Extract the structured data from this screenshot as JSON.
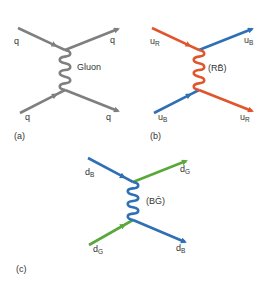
{
  "colors": {
    "gray": "#7f7f7f",
    "red": "#e0552b",
    "blue": "#2f6fb5",
    "green": "#5aa83c",
    "text": "#333333"
  },
  "panels": [
    {
      "id": "a",
      "caption": "(a)",
      "mediator_label": "Gluon",
      "mediator_color": "gray",
      "legs": [
        {
          "position": "top-left",
          "label": "q",
          "subscript": "",
          "color": "gray"
        },
        {
          "position": "top-right",
          "label": "q",
          "subscript": "",
          "color": "gray"
        },
        {
          "position": "bottom-left",
          "label": "q",
          "subscript": "",
          "color": "gray"
        },
        {
          "position": "bottom-right",
          "label": "q",
          "subscript": "",
          "color": "gray"
        }
      ]
    },
    {
      "id": "b",
      "caption": "(b)",
      "mediator_label": "(RB̄)",
      "mediator_color": "red",
      "legs": [
        {
          "position": "top-left",
          "label": "u",
          "subscript": "R",
          "color": "red"
        },
        {
          "position": "top-right",
          "label": "u",
          "subscript": "B",
          "color": "blue"
        },
        {
          "position": "bottom-left",
          "label": "u",
          "subscript": "B",
          "color": "blue"
        },
        {
          "position": "bottom-right",
          "label": "u",
          "subscript": "R",
          "color": "red"
        }
      ]
    },
    {
      "id": "c",
      "caption": "(c)",
      "mediator_label": "(BḠ)",
      "mediator_color": "blue",
      "legs": [
        {
          "position": "top-left",
          "label": "d",
          "subscript": "B",
          "color": "blue"
        },
        {
          "position": "top-right",
          "label": "d",
          "subscript": "G",
          "color": "green"
        },
        {
          "position": "bottom-left",
          "label": "d",
          "subscript": "G",
          "color": "green"
        },
        {
          "position": "bottom-right",
          "label": "d",
          "subscript": "B",
          "color": "blue"
        }
      ]
    }
  ]
}
